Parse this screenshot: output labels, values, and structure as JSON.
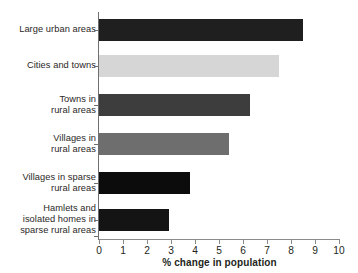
{
  "chart_data": {
    "type": "bar",
    "orientation": "horizontal",
    "title": "",
    "xlabel": "% change in population",
    "ylabel": "",
    "xlim": [
      0,
      10
    ],
    "xticks": [
      "0",
      "1",
      "2",
      "3",
      "4",
      "5",
      "6",
      "7",
      "8",
      "9",
      "10"
    ],
    "grid": false,
    "legend": false,
    "categories": [
      "Large urban areas",
      "Cities and towns",
      "Towns in\nrural areas",
      "Villages in\nrural areas",
      "Villages in sparse\nrural areas",
      "Hamlets and\nisolated homes in\nsparse rural areas"
    ],
    "values": [
      8.5,
      7.5,
      6.3,
      5.4,
      3.8,
      2.9
    ],
    "bar_colors": [
      "#201f1f",
      "#d6d6d6",
      "#3e3d3d",
      "#6f6e6e",
      "#0d0c0c",
      "#151414"
    ]
  }
}
